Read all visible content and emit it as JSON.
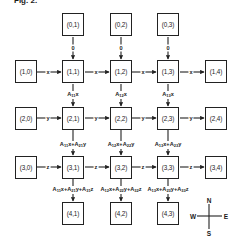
{
  "figure": {
    "title": "Fig. 2."
  },
  "nodes": {
    "top": [
      "(0,1)",
      "(0,2)",
      "(0,3)"
    ],
    "row1": [
      "(1,0)",
      "(1,1)",
      "(1,2)",
      "(1,3)",
      "(1,4)"
    ],
    "row2": [
      "(2,0)",
      "(2,1)",
      "(2,2)",
      "(2,3)",
      "(2,4)"
    ],
    "row3": [
      "(3,0)",
      "(3,1)",
      "(3,2)",
      "(3,3)",
      "(3,4)"
    ],
    "bottom": [
      "(4,1)",
      "(4,2)",
      "(4,3)"
    ]
  },
  "edges": {
    "top_inputs": [
      "0",
      "0",
      "0"
    ],
    "row1_horizontal": [
      "x",
      "x",
      "x",
      "x"
    ],
    "row2_horizontal": [
      "y",
      "y",
      "y",
      "y"
    ],
    "row3_horizontal": [
      "z",
      "z",
      "z",
      "z"
    ],
    "row1_to_row2": [
      {
        "a": "A",
        "s": "11",
        "v": "x"
      },
      {
        "a": "A",
        "s": "12",
        "v": "x"
      },
      {
        "a": "A",
        "s": "13",
        "v": "x"
      }
    ],
    "row2_to_row3": [
      {
        "t1": "A",
        "s1": "11",
        "v1": "x+A",
        "s2": "21",
        "v2": "y"
      },
      {
        "t1": "A",
        "s1": "12",
        "v1": "x+A",
        "s2": "22",
        "v2": "y"
      },
      {
        "t1": "A",
        "s1": "13",
        "v1": "x+A",
        "s2": "23",
        "v2": "y"
      }
    ],
    "row3_to_bottom": [
      {
        "t1": "A",
        "s1": "11",
        "v1": "x+A",
        "s2": "21",
        "v2": "y+A",
        "s3": "31",
        "v3": "z"
      },
      {
        "t1": "A",
        "s1": "12",
        "v1": "x+A",
        "s2": "22",
        "v2": "y+A",
        "s3": "32",
        "v3": "z"
      },
      {
        "t1": "A",
        "s1": "13",
        "v1": "x+A",
        "s2": "23",
        "v2": "y+A",
        "s3": "33",
        "v3": "z"
      }
    ]
  },
  "compass": {
    "north": "N",
    "south": "S",
    "east": "E",
    "west": "W"
  }
}
